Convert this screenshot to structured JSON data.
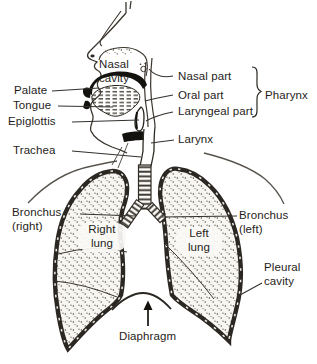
{
  "labels": {
    "nasal_cavity": "Nasal cavity",
    "palate": "Palate",
    "tongue": "Tongue",
    "epiglottis": "Epiglottis",
    "trachea": "Trachea",
    "nasal_part": "Nasal part",
    "oral_part": "Oral part",
    "laryngeal_part": "Laryngeal part",
    "pharynx": "Pharynx",
    "larynx": "Larynx",
    "bronchus_right": "Bronchus (right)",
    "right_lung": "Right lung",
    "left_lung": "Left lung",
    "bronchus_left": "Bronchus (left)",
    "pleural_cavity": "Pleural cavity",
    "diaphragm": "Diaphragm"
  },
  "colors": {
    "ink": "#2b2722",
    "paper": "#ffffff",
    "lung_fill": "#f7f6f2"
  }
}
